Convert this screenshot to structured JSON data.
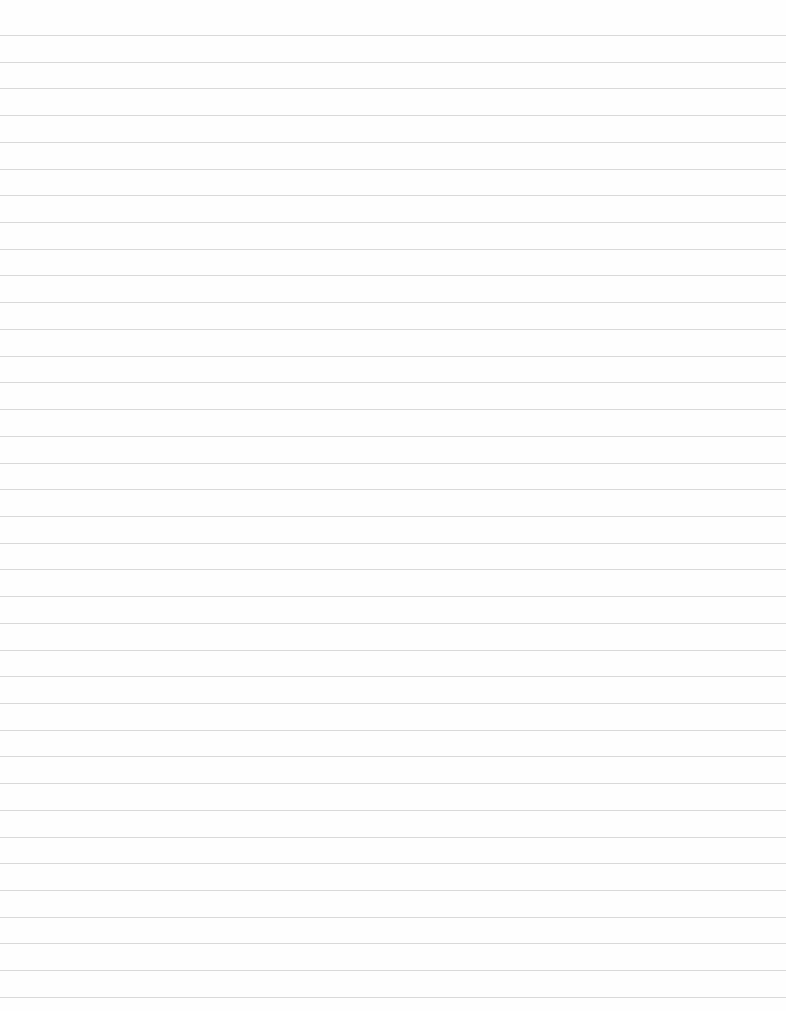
{
  "document": {
    "type": "lined-paper",
    "rule_count": 37,
    "first_rule_y": 35,
    "rule_spacing": 26.72,
    "rule_color": "#cfcfcf",
    "background": "#fefefe"
  }
}
